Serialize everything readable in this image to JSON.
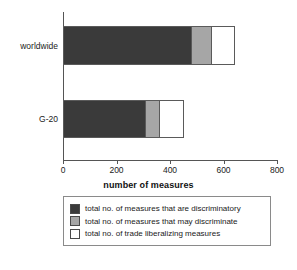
{
  "chart_data": {
    "type": "bar",
    "orientation": "horizontal",
    "stacked": true,
    "title": "",
    "xlabel": "number of measures",
    "ylabel": "",
    "xlim": [
      0,
      800
    ],
    "xticks": [
      0,
      200,
      400,
      600,
      800
    ],
    "xtick_labels": [
      "0",
      "200",
      "400",
      "600",
      "800"
    ],
    "grid": false,
    "legend_position": "bottom",
    "categories": [
      "worldwide",
      "G-20"
    ],
    "series": [
      {
        "name": "total no. of measures that are discriminatory",
        "color": "#3a3a3a",
        "values": [
          482,
          310
        ]
      },
      {
        "name": "total no. of measures that may discriminate",
        "color": "#a6a6a6",
        "values": [
          75,
          53
        ]
      },
      {
        "name": "total no. of trade liberalizing measures",
        "color": "#ffffff",
        "values": [
          86,
          89
        ]
      }
    ],
    "totals": [
      643,
      452
    ]
  },
  "axis": {
    "x_title": "number of measures",
    "ticks": [
      {
        "label": "0",
        "value": 0
      },
      {
        "label": "200",
        "value": 200
      },
      {
        "label": "400",
        "value": 400
      },
      {
        "label": "600",
        "value": 600
      },
      {
        "label": "800",
        "value": 800
      }
    ]
  },
  "categories": {
    "worldwide": "worldwide",
    "g20": "G-20"
  },
  "legend": {
    "items": [
      {
        "label": "total no. of measures that are discriminatory",
        "swatch": "dark-swatch-icon",
        "color": "#3a3a3a"
      },
      {
        "label": "total no. of measures that may discriminate",
        "swatch": "gray-swatch-icon",
        "color": "#a6a6a6"
      },
      {
        "label": "total no. of trade liberalizing measures",
        "swatch": "white-swatch-icon",
        "color": "#ffffff"
      }
    ]
  }
}
